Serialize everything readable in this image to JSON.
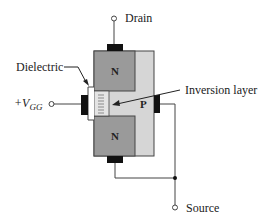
{
  "diagram": {
    "labels": {
      "drain": "Drain",
      "source": "Source",
      "dielectric": "Dielectric",
      "inversion_layer": "Inversion layer",
      "gate_voltage_prefix": "+V",
      "gate_voltage_sub": "GG"
    },
    "regions": {
      "top_n": "N",
      "bottom_n": "N",
      "substrate": "P"
    },
    "colors": {
      "n_region": "#9a9a9a",
      "p_substrate": "#d6d6d6",
      "contact": "#111111",
      "dielectric": "#ffffff",
      "inversion": "#e2e2e2",
      "wire": "#444444"
    }
  }
}
